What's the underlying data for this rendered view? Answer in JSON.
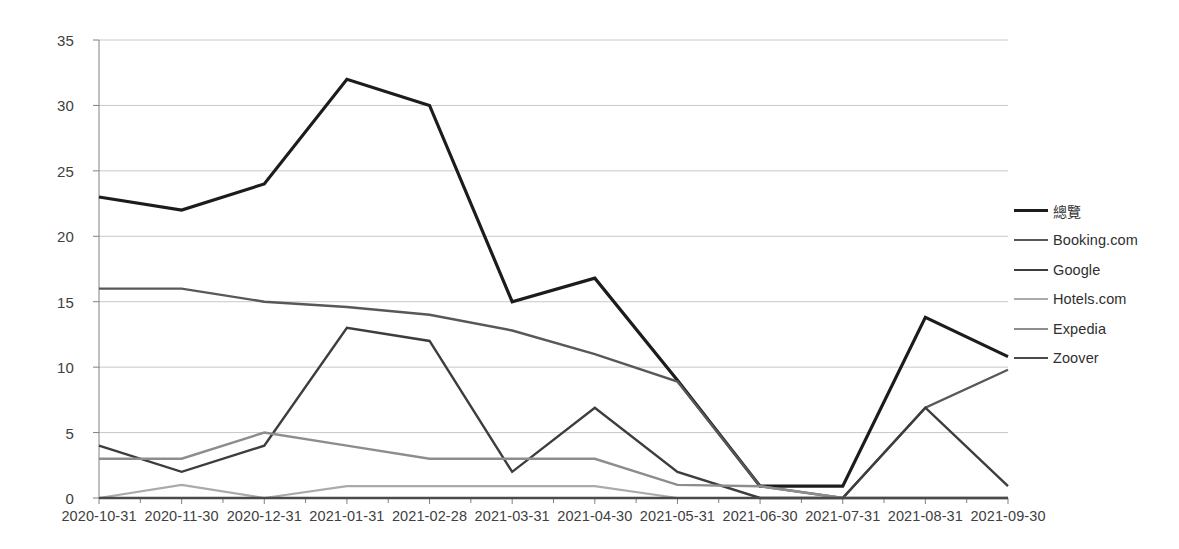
{
  "chart_data": {
    "type": "line",
    "title": "",
    "xlabel": "",
    "ylabel": "",
    "ylim": [
      0,
      35
    ],
    "ytick_step": 5,
    "yticks": [
      0,
      5,
      10,
      15,
      20,
      25,
      30,
      35
    ],
    "grid": true,
    "legend_position": "right",
    "categories": [
      "2020-10-31",
      "2020-11-30",
      "2020-12-31",
      "2021-01-31",
      "2021-02-28",
      "2021-03-31",
      "2021-04-30",
      "2021-05-31",
      "2021-06-30",
      "2021-07-31",
      "2021-08-31",
      "2021-09-30"
    ],
    "series": [
      {
        "name": "總覽",
        "color": "#1c1c1c",
        "width": 3.2,
        "values": [
          23,
          22,
          24,
          32,
          30,
          15,
          16.8,
          9,
          0.9,
          0.9,
          13.8,
          10.8
        ]
      },
      {
        "name": "Booking.com",
        "color": "#585858",
        "width": 2.4,
        "values": [
          16,
          16,
          15,
          14.6,
          14,
          12.8,
          11,
          8.9,
          0.9,
          0,
          6.9,
          9.8
        ]
      },
      {
        "name": "Google",
        "color": "#3d3d3d",
        "width": 2.4,
        "values": [
          4,
          2,
          4,
          13,
          12,
          2,
          6.9,
          2,
          0,
          0,
          6.9,
          0.9
        ]
      },
      {
        "name": "Hotels.com",
        "color": "#aaaaaa",
        "width": 2.2,
        "values": [
          0,
          1,
          0,
          0.9,
          0.9,
          0.9,
          0.9,
          0,
          0,
          0,
          0,
          0
        ]
      },
      {
        "name": "Expedia",
        "color": "#8d8d8d",
        "width": 2.4,
        "values": [
          3,
          3,
          5,
          4,
          3,
          3,
          3,
          1,
          0.9,
          0,
          0,
          0
        ]
      },
      {
        "name": "Zoover",
        "color": "#4a4a4a",
        "width": 2.4,
        "values": [
          0,
          0,
          0,
          0,
          0,
          0,
          0,
          0,
          0,
          0,
          0,
          0
        ]
      }
    ]
  },
  "axis": {
    "grid_color": "#c8c8c8",
    "axis_color": "#808080",
    "tick_color": "#808080"
  },
  "legend": {
    "items": [
      {
        "label": "總覽"
      },
      {
        "label": "Booking.com"
      },
      {
        "label": "Google"
      },
      {
        "label": "Hotels.com"
      },
      {
        "label": "Expedia"
      },
      {
        "label": "Zoover"
      }
    ]
  }
}
